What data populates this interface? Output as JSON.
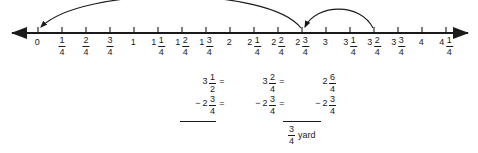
{
  "figure": {
    "background_color": "#ffffff",
    "ink_color": "#1a1a1a"
  },
  "numberline": {
    "axis_y": 33,
    "left_arrow_x": 10,
    "right_arrow_x": 468,
    "tick_spacing": 24,
    "first_tick_x": 38,
    "tick_count": 18,
    "ticks": [
      {
        "index": 0,
        "x": 38,
        "value": 0,
        "whole": "0",
        "num": "",
        "den": ""
      },
      {
        "index": 1,
        "x": 62,
        "value": 0.25,
        "whole": "",
        "num": "1",
        "den": "4"
      },
      {
        "index": 2,
        "x": 86,
        "value": 0.5,
        "whole": "",
        "num": "2",
        "den": "4"
      },
      {
        "index": 3,
        "x": 110,
        "value": 0.75,
        "whole": "",
        "num": "3",
        "den": "4"
      },
      {
        "index": 4,
        "x": 134,
        "value": 1,
        "whole": "1",
        "num": "",
        "den": ""
      },
      {
        "index": 5,
        "x": 158,
        "value": 1.25,
        "whole": "1",
        "num": "1",
        "den": "4"
      },
      {
        "index": 6,
        "x": 182,
        "value": 1.5,
        "whole": "1",
        "num": "2",
        "den": "4"
      },
      {
        "index": 7,
        "x": 206,
        "value": 1.75,
        "whole": "1",
        "num": "3",
        "den": "4"
      },
      {
        "index": 8,
        "x": 230,
        "value": 2,
        "whole": "2",
        "num": "",
        "den": ""
      },
      {
        "index": 9,
        "x": 254,
        "value": 2.25,
        "whole": "2",
        "num": "1",
        "den": "4"
      },
      {
        "index": 10,
        "x": 278,
        "value": 2.5,
        "whole": "2",
        "num": "2",
        "den": "4"
      },
      {
        "index": 11,
        "x": 302,
        "value": 2.75,
        "whole": "2",
        "num": "3",
        "den": "4"
      },
      {
        "index": 12,
        "x": 326,
        "value": 3,
        "whole": "3",
        "num": "",
        "den": ""
      },
      {
        "index": 13,
        "x": 350,
        "value": 3.25,
        "whole": "3",
        "num": "1",
        "den": "4"
      },
      {
        "index": 14,
        "x": 374,
        "value": 3.5,
        "whole": "3",
        "num": "2",
        "den": "4"
      },
      {
        "index": 15,
        "x": 398,
        "value": 3.75,
        "whole": "3",
        "num": "3",
        "den": "4"
      },
      {
        "index": 16,
        "x": 422,
        "value": 4,
        "whole": "4",
        "num": "",
        "den": ""
      },
      {
        "index": 17,
        "x": 446,
        "value": 4.25,
        "whole": "4",
        "num": "1",
        "den": "4"
      }
    ],
    "jumps": [
      {
        "name": "long-jump",
        "from_value": 2.75,
        "to_value": 0,
        "from_x": 302,
        "to_x": 38,
        "apex_y": 2,
        "direction": "left"
      },
      {
        "name": "short-jump",
        "from_value": 3.5,
        "to_value": 2.75,
        "from_x": 374,
        "to_x": 302,
        "apex_y": 13,
        "direction": "left"
      }
    ]
  },
  "equation": {
    "minuend": {
      "original": {
        "whole": "3",
        "num": "1",
        "den": "2"
      },
      "converted": {
        "whole": "3",
        "num": "2",
        "den": "4"
      },
      "regrouped": {
        "whole": "2",
        "num": "6",
        "den": "4"
      }
    },
    "subtrahend": {
      "sign": "−",
      "original": {
        "whole": "2",
        "num": "3",
        "den": "4"
      },
      "converted": {
        "whole": "2",
        "num": "3",
        "den": "4"
      },
      "regrouped": {
        "whole": "2",
        "num": "3",
        "den": "4"
      }
    },
    "equals_1": "=",
    "equals_2": "=",
    "eq_before_col2": "=",
    "eq_before_col3": "=",
    "answer": {
      "whole": "",
      "num": "3",
      "den": "4",
      "unit": "yard"
    }
  }
}
